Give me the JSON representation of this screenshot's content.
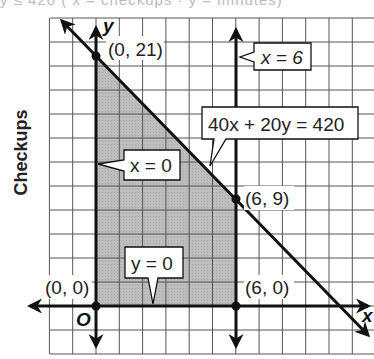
{
  "top_text": "y ≤ 420 ( x = checkups · y = minutes)",
  "chart_data": {
    "type": "line",
    "title": "",
    "xlabel": "x",
    "ylabel": "Checkups",
    "axis_labels": {
      "x": "x",
      "y": "y",
      "origin": "O"
    },
    "x_unit_per_grid": 1,
    "y_unit_per_grid": 2,
    "grid": true,
    "lines": [
      {
        "equation": "40x + 20y = 420",
        "points": [
          [
            0,
            21
          ],
          [
            10.5,
            0
          ]
        ]
      },
      {
        "equation": "x = 6",
        "points": [
          [
            6,
            -4
          ],
          [
            6,
            23
          ]
        ]
      },
      {
        "equation": "x = 0"
      },
      {
        "equation": "y = 0"
      }
    ],
    "feasible_region": [
      [
        0,
        0
      ],
      [
        0,
        21
      ],
      [
        6,
        9
      ],
      [
        6,
        0
      ]
    ],
    "points": [
      {
        "label": "(0, 21)",
        "x": 0,
        "y": 21
      },
      {
        "label": "(6, 9)",
        "x": 6,
        "y": 9
      },
      {
        "label": "(0, 0)",
        "x": 0,
        "y": 0
      },
      {
        "label": "(6, 0)",
        "x": 6,
        "y": 0
      }
    ],
    "callouts": [
      "x = 6",
      "40x + 20y = 420",
      "x = 0",
      "y = 0"
    ]
  },
  "labels": {
    "ylabel": "Checkups",
    "p021": "(0, 21)",
    "p69": "(6, 9)",
    "p00": "(0, 0)",
    "p60": "(6, 0)",
    "origin": "O",
    "xaxis": "x",
    "yaxis": "y",
    "c_x6": "x = 6",
    "c_line": "40x + 20y = 420",
    "c_x0": "x = 0",
    "c_y0": "y = 0"
  },
  "colors": {
    "region": "#b8b8b8",
    "grid": "#555555",
    "ink": "#111111"
  }
}
